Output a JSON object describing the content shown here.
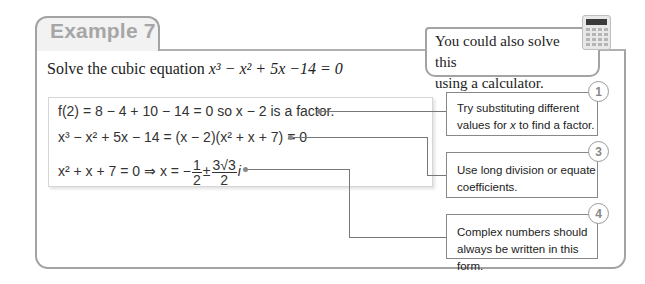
{
  "example": {
    "tab_label": "Example 7",
    "problem_prefix": "Solve the cubic equation ",
    "problem_equation": "x³ − x² + 5x −14 = 0"
  },
  "calculator_tip": {
    "line1": "You could also solve this",
    "line2": "using a calculator.",
    "icon": "calculator-icon"
  },
  "working": {
    "line1": {
      "text": "f(2) = 8 − 4 + 10 − 14 = 0 so x − 2 is a factor."
    },
    "line2": {
      "text": "x³ − x² + 5x − 14 = (x − 2)(x² + x + 7) = 0"
    },
    "line3": {
      "lhs": "x² + x + 7 = 0 ⇒ x = −",
      "frac1_num": "1",
      "frac1_den": "2",
      "pm": "±",
      "frac2_num": "3√3",
      "frac2_den": "2",
      "suffix": "i"
    }
  },
  "callouts": [
    {
      "number": "1",
      "line1": "Try substituting different",
      "line2_pre": "values for ",
      "line2_var": "x",
      "line2_post": " to find a factor."
    },
    {
      "number": "3",
      "line1": "Use long division or equate",
      "line2": "coefficients."
    },
    {
      "number": "4",
      "line1": "Complex numbers should",
      "line2": "always be written in this form."
    }
  ]
}
